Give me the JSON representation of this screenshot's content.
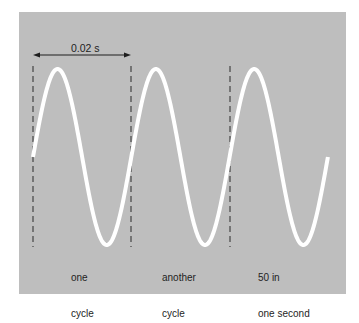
{
  "colors": {
    "background": "#ffffff",
    "panel": "#bebebe",
    "wave": "#ffffff",
    "text": "#1e1e1e",
    "dash": "#2a2a2a"
  },
  "period_annotation": {
    "label": "0.02 s"
  },
  "labels": [
    {
      "line1": "one",
      "line2": "cycle"
    },
    {
      "line1": "another",
      "line2": "cycle"
    },
    {
      "line1": "50 in",
      "line2": "one second"
    }
  ],
  "chart_data": {
    "type": "line",
    "title": "",
    "period_seconds": 0.02,
    "frequency_hz": 50,
    "cycles_shown": 3,
    "series": [
      {
        "name": "sine wave",
        "function": "sin",
        "cycles": 3,
        "start_phase": 0
      }
    ],
    "markers": [
      "cycle start 1",
      "cycle start 2",
      "cycle start 3"
    ],
    "annotations": [
      "0.02 s",
      "one cycle",
      "another cycle",
      "50 in one second"
    ],
    "xlabel": "",
    "ylabel": "",
    "grid": false
  }
}
